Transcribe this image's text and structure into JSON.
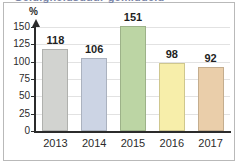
{
  "title": {
    "text": "Geldigheidsduur gemiddeld",
    "note": "cropped-off at top of image, illegible"
  },
  "chart_data": {
    "type": "bar",
    "title": "",
    "xlabel": "",
    "ylabel": "%",
    "categories": [
      "2013",
      "2014",
      "2015",
      "2016",
      "2017"
    ],
    "values": [
      118,
      106,
      151,
      98,
      92
    ],
    "ylim": [
      0,
      150
    ],
    "yticks": [
      0,
      25,
      50,
      75,
      100,
      125,
      150
    ],
    "ytick_labels": [
      "0",
      "25",
      "50",
      "75",
      "100",
      "125",
      "150"
    ],
    "grid": true,
    "legend": "none",
    "bar_colors": [
      "#d2d3d0",
      "#ccd4e4",
      "#bcd5a4",
      "#f7eeaa",
      "#eaceaa"
    ],
    "value_label_position": "above-bar",
    "axis_arrow": "up"
  },
  "axis": {
    "unit_label": "%"
  },
  "colors": {
    "axis": "#2b2b2b",
    "grid": "#e2e2e2",
    "border": "#b9b9b9",
    "title": "#7b86a8",
    "text": "#2b2b2b"
  }
}
